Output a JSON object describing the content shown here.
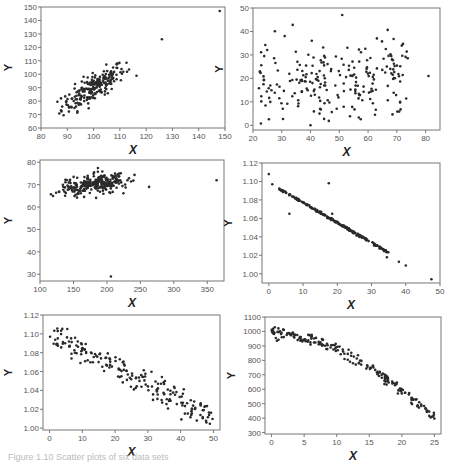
{
  "chart_data": [
    {
      "type": "scatter",
      "title": "",
      "xlabel": "X",
      "ylabel": "Y",
      "xlim": [
        80,
        150
      ],
      "ylim": [
        60,
        150
      ],
      "xticks": [
        80,
        90,
        100,
        110,
        120,
        130,
        140,
        150
      ],
      "yticks": [
        60,
        70,
        80,
        90,
        100,
        110,
        120,
        130,
        140,
        150
      ],
      "grid": false,
      "description": "strong positive linear cluster with two high outliers",
      "cluster": {
        "x_mean": 100,
        "x_sd": 6,
        "slope": 1.15,
        "intercept": -25,
        "noise_sd": 5,
        "n": 220
      },
      "outliers": [
        [
          126,
          126
        ],
        [
          148,
          147
        ]
      ],
      "box": {
        "left": 41,
        "top": 7,
        "right": 225,
        "bottom": 128
      }
    },
    {
      "type": "scatter",
      "title": "",
      "xlabel": "X",
      "ylabel": "Y",
      "xlim": [
        20,
        85
      ],
      "ylim": [
        -2,
        50
      ],
      "xticks": [
        20,
        30,
        40,
        50,
        60,
        70,
        80
      ],
      "yticks": [
        0,
        10,
        20,
        30,
        40,
        50
      ],
      "grid": false,
      "description": "weak positive relationship with wide scatter",
      "cluster": {
        "x_min": 22,
        "x_max": 74,
        "slope": 0.15,
        "intercept": 12,
        "noise_sd": 8,
        "n": 230
      },
      "outliers": [
        [
          51,
          47
        ],
        [
          81,
          21
        ],
        [
          40,
          0
        ]
      ],
      "box": {
        "left": 253,
        "top": 8,
        "right": 440,
        "bottom": 130
      }
    },
    {
      "type": "scatter",
      "title": "",
      "xlabel": "X",
      "ylabel": "Y",
      "xlim": [
        100,
        375
      ],
      "ylim": [
        27,
        81
      ],
      "xticks": [
        100,
        150,
        200,
        250,
        300,
        350
      ],
      "yticks": [
        30,
        40,
        50,
        60,
        70,
        80
      ],
      "grid": false,
      "description": "dense positive cluster at top-left with outliers",
      "cluster": {
        "x_mean": 180,
        "x_sd": 25,
        "slope": 0.04,
        "intercept": 63,
        "noise_sd": 2.2,
        "n": 260
      },
      "outliers": [
        [
          206,
          29
        ],
        [
          263,
          69
        ],
        [
          364,
          72
        ]
      ],
      "box": {
        "left": 40,
        "top": 160,
        "right": 224,
        "bottom": 281
      }
    },
    {
      "type": "scatter",
      "title": "",
      "xlabel": "X",
      "ylabel": "Y",
      "xlim": [
        -2,
        50
      ],
      "ylim": [
        0.99,
        1.12
      ],
      "xticks": [
        0,
        10,
        20,
        30,
        40,
        50
      ],
      "yticks": [
        1.0,
        1.02,
        1.04,
        1.06,
        1.08,
        1.1,
        1.12
      ],
      "grid": false,
      "description": "near-perfect negative linear relationship with a few outliers",
      "cluster": {
        "x_min": 3,
        "x_max": 35,
        "slope": -0.00216,
        "intercept": 1.0985,
        "noise_sd": 0.0006,
        "n": 200
      },
      "outliers": [
        [
          0,
          1.108
        ],
        [
          1,
          1.097
        ],
        [
          6,
          1.065
        ],
        [
          17.5,
          1.098
        ],
        [
          18.5,
          1.065
        ],
        [
          34.5,
          1.018
        ],
        [
          38,
          1.013
        ],
        [
          40,
          1.009
        ],
        [
          47.5,
          0.994
        ]
      ],
      "box": {
        "left": 262,
        "top": 163,
        "right": 440,
        "bottom": 283
      }
    },
    {
      "type": "scatter",
      "title": "",
      "xlabel": "X",
      "ylabel": "Y",
      "xlim": [
        -2,
        52
      ],
      "ylim": [
        0.998,
        1.12
      ],
      "xticks": [
        0,
        10,
        20,
        30,
        40,
        50
      ],
      "yticks": [
        1.0,
        1.02,
        1.04,
        1.06,
        1.08,
        1.1,
        1.12
      ],
      "grid": false,
      "description": "negative linear relationship with moderate scatter",
      "cluster": {
        "x_min": 0,
        "x_max": 50,
        "slope": -0.0018,
        "intercept": 1.1,
        "noise_sd": 0.007,
        "n": 200
      },
      "outliers": [],
      "box": {
        "left": 43,
        "top": 315,
        "right": 220,
        "bottom": 430
      }
    },
    {
      "type": "scatter",
      "title": "",
      "xlabel": "X",
      "ylabel": "Y",
      "xlim": [
        -1,
        26
      ],
      "ylim": [
        290,
        1100
      ],
      "xticks": [
        0,
        5,
        10,
        15,
        20,
        25
      ],
      "yticks": [
        300,
        400,
        500,
        600,
        700,
        800,
        900,
        1000,
        1100
      ],
      "grid": false,
      "description": "concave-down curved negative relationship",
      "cluster": {
        "x_min": 0,
        "x_max": 25,
        "quadratic": [
          1000,
          -5,
          -0.77
        ],
        "noise_sd": 18,
        "n": 200
      },
      "outliers": [],
      "box": {
        "left": 265,
        "top": 317,
        "right": 441,
        "bottom": 434
      }
    }
  ],
  "labels": {
    "x_axis": "X",
    "y_axis": "Y",
    "caption": "Figure 1.10  Scatter plots of six data sets"
  }
}
